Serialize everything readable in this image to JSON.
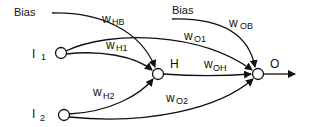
{
  "diagram": {
    "type": "neural-network",
    "nodes": {
      "bias_h": {
        "label": "Bias"
      },
      "bias_o": {
        "label": "Bias"
      },
      "i1": {
        "label": "I",
        "sub": "1"
      },
      "i2": {
        "label": "I",
        "sub": "2"
      },
      "h": {
        "label": "H"
      },
      "o": {
        "label": "O"
      }
    },
    "edges": {
      "whb": {
        "label": "w",
        "sub": "HB",
        "from": "Bias",
        "to": "H"
      },
      "wh1": {
        "label": "w",
        "sub": "H1",
        "from": "I1",
        "to": "H"
      },
      "wh2": {
        "label": "w",
        "sub": "H2",
        "from": "I2",
        "to": "H"
      },
      "wo1": {
        "label": "w",
        "sub": "O1",
        "from": "I1",
        "to": "O"
      },
      "wo2": {
        "label": "w",
        "sub": "O2",
        "from": "I2",
        "to": "O"
      },
      "woh": {
        "label": "w",
        "sub": "OH",
        "from": "H",
        "to": "O"
      },
      "wob": {
        "label": "w",
        "sub": "OB",
        "from": "Bias",
        "to": "O"
      }
    },
    "colors": {
      "stroke": "#111111",
      "node_fill": "#ffffff"
    }
  }
}
